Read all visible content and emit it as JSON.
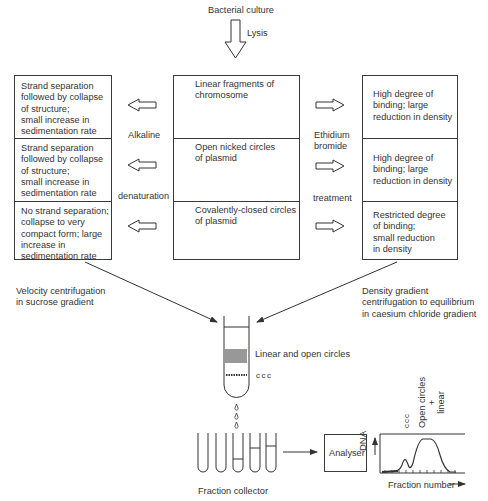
{
  "top": {
    "source_label": "Bacterial culture",
    "process_label": "Lysis"
  },
  "center_box": {
    "cells": [
      {
        "label": "Linear fragments of\nchromosome",
        "icon": "linear-dna-fragments"
      },
      {
        "label": "Open nicked circles\nof plasmid",
        "icon": "open-circle-plasmid"
      },
      {
        "label": "Covalently-closed circles\nof plasmid",
        "icon": "supercoiled-plasmid"
      }
    ]
  },
  "left_treatment": {
    "label_top": "Alkaline",
    "label_bottom": "denaturation"
  },
  "right_treatment": {
    "label_top": "Ethidium\nbromide",
    "label_bottom": "treatment"
  },
  "left_box": {
    "cells": [
      {
        "text": "Strand separation\nfollowed by collapse\nof structure;\nsmall increase in\nsedimentation rate"
      },
      {
        "text": "Strand separation\nfollowed by collapse\nof structure;\nsmall increase in\nsedimentation rate"
      },
      {
        "text": "No strand separation;\ncollapse to very\ncompact form; large\nincrease in\nsedimentation rate"
      }
    ]
  },
  "right_box": {
    "cells": [
      {
        "text": "High degree of\nbinding; large\nreduction in density"
      },
      {
        "text": "High degree of\nbinding; large\nreduction in density"
      },
      {
        "text": "Restricted degree\nof binding;\nsmall reduction\nin density"
      }
    ]
  },
  "methods": {
    "left": "Velocity centrifugation\nin sucrose gradient",
    "right": "Density gradient\ncentrifugation to equilibrium\nin caesium chloride gradient"
  },
  "tube": {
    "band_upper_label": "Linear and open circles",
    "band_lower_label": "ccc"
  },
  "bottom": {
    "collector_label": "Fraction collector",
    "analyser_label": "Analyser",
    "graph": {
      "y_label": "DNA",
      "x_label": "Fraction number",
      "peak1_label": "ccc",
      "peak2_label": "Open circles\n+\nlinear"
    }
  },
  "colors": {
    "line": "#333333",
    "text": "#333333",
    "background": "#ffffff"
  }
}
